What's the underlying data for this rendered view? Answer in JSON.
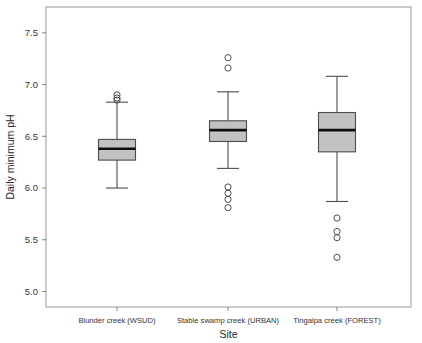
{
  "chart_data": {
    "type": "box",
    "title": "",
    "xlabel": "Site",
    "ylabel": "Daily minimum pH",
    "categories": [
      "Blunder creek (WSUD)",
      "Stable swamp creek (URBAN)",
      "Tingalpa creek (FOREST)"
    ],
    "ylim": [
      4.85,
      7.75
    ],
    "yticks": [
      5.0,
      5.5,
      6.0,
      6.5,
      7.0,
      7.5
    ],
    "ytick_labels": [
      "5.0",
      "5.5",
      "6.0",
      "6.5",
      "7.0",
      "7.5"
    ],
    "grid": false,
    "legend": "none",
    "box_fill_color": "#c2c2c2",
    "box_edge_color": "#4d4d4d",
    "median_color": "#0d0d0d",
    "boxes": [
      {
        "category": "Blunder creek (WSUD)",
        "whisker_low": 6.0,
        "q1": 6.27,
        "median": 6.38,
        "q3": 6.47,
        "whisker_high": 6.83,
        "outliers": [
          6.9,
          6.87,
          6.85
        ]
      },
      {
        "category": "Stable swamp creek (URBAN)",
        "whisker_low": 6.19,
        "q1": 6.45,
        "median": 6.56,
        "q3": 6.65,
        "whisker_high": 6.93,
        "outliers": [
          7.26,
          7.16,
          6.01,
          5.95,
          5.89,
          5.81
        ]
      },
      {
        "category": "Tingalpa creek (FOREST)",
        "whisker_low": 5.87,
        "q1": 6.35,
        "median": 6.56,
        "q3": 6.73,
        "whisker_high": 7.08,
        "outliers": [
          5.71,
          5.58,
          5.52,
          5.33
        ]
      }
    ]
  }
}
